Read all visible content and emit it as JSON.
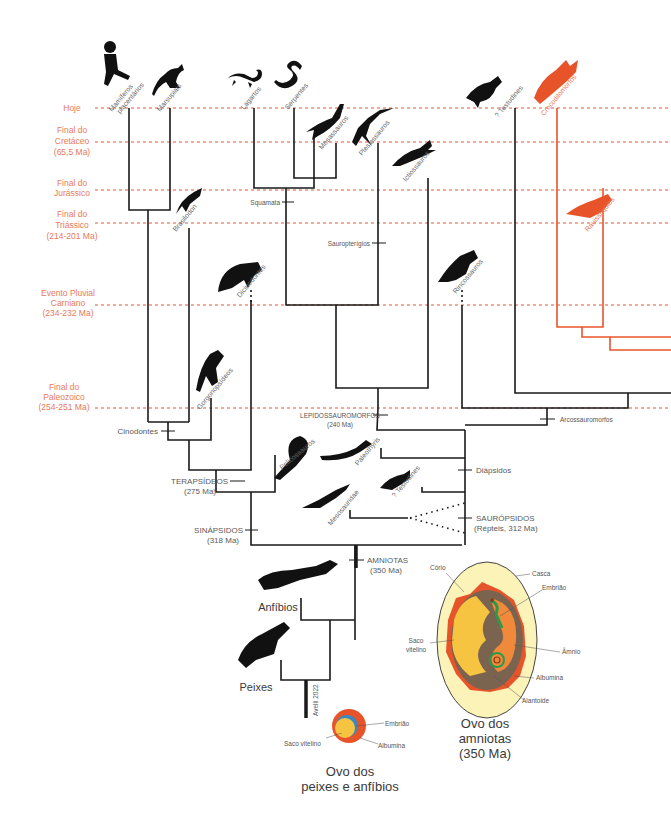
{
  "colors": {
    "line": "#1a1a1a",
    "accent": "#e8542a",
    "era_text": "#e8795a",
    "era_line": "#e8542a",
    "label_text": "#6a6a6a"
  },
  "eras": [
    {
      "label_lines": [
        "Hoje"
      ],
      "y": 108
    },
    {
      "label_lines": [
        "Final do",
        "Cretáceo",
        "(65,5 Ma)"
      ],
      "y": 142
    },
    {
      "label_lines": [
        "Final do",
        "Jurássico"
      ],
      "y": 190
    },
    {
      "label_lines": [
        "Final do",
        "Triássico",
        "(214-201 Ma)"
      ],
      "y": 223
    },
    {
      "label_lines": [
        "Evento Pluvial",
        "Carniano",
        "(234-232 Ma)"
      ],
      "y": 305
    },
    {
      "label_lines": [
        "Final do",
        "Paleozoico",
        "(254-251 Ma)"
      ],
      "y": 408
    }
  ],
  "taxa": {
    "mamiferos": "Mamíferos placentários",
    "mamiferos_l1": "Mamíferos",
    "mamiferos_l2": "placentários",
    "marsupiais": "Marsupiais",
    "brasilodon": "Brasilodon",
    "dicinodontes": "Dicinodontes",
    "gorgonopsideos": "Gorgonopsídeos",
    "lagartos": "Lagartos",
    "serpentes": "Serpentes",
    "mosassauros": "Mosassauros",
    "plesiossauros": "Plesiossauros",
    "ictiossauros": "Ictiossauros",
    "rincossauros": "Rincossauros",
    "testudines_top": "? Testudines",
    "crocodilomorfos": "Crocodilomorfos",
    "rauissuquios": "Rauissúquios",
    "pelicossauros": "Pelicossauros",
    "paleothyris": "Paleothyris",
    "testudines_low": "? Testudines",
    "mesosauridae": "Mesosauridae"
  },
  "clades": {
    "squamata": "Squamata",
    "sauropterigios": "Sauropterígios",
    "lepido_l1": "LEPIDOSSAUROMORFOS",
    "lepido_l2": "(240 Ma)",
    "arcossauromorfos": "Arcossauromorfos",
    "cinodontes": "Cinodontes",
    "terap_l1": "TERAPSÍDEOS",
    "terap_l2": "(275 Ma)",
    "sinap_l1": "SINÁPSIDOS",
    "sinap_l2": "(318 Ma)",
    "diapsidos": "Diápsidos",
    "saurop_l1": "SAURÓPSIDOS",
    "saurop_l2": "(Répteis, 312 Ma)",
    "amniotas_l1": "AMNIOTAS",
    "amniotas_l2": "(350 Ma)",
    "anfibios": "Anfíbios",
    "peixes": "Peixes"
  },
  "credit": "Avelli 2022",
  "amniote_egg": {
    "title_l1": "Ovo dos",
    "title_l2": "amniotas",
    "title_l3": "(350 Ma)",
    "labels": {
      "corio": "Cório",
      "casca": "Casca",
      "embriao": "Embrião",
      "saco_l1": "Saco",
      "saco_l2": "vitelino",
      "amnio": "Âmnio",
      "albumina": "Albumina",
      "alantoide": "Alantoide"
    }
  },
  "fish_egg": {
    "title_l1": "Ovo dos",
    "title_l2": "peixes e anfíbios",
    "labels": {
      "embriao": "Embrião",
      "saco": "Saco vitelino",
      "albumina": "Albumina"
    }
  }
}
